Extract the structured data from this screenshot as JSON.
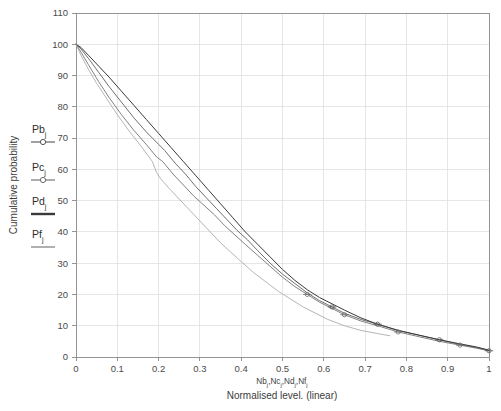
{
  "chart_data": {
    "type": "line",
    "title": "",
    "xlabel": "Normalised level. (linear)",
    "xlabel_secondary": "Nbj,Ncj,Ndj,Nfj",
    "ylabel": "Cumulative probability",
    "xlim": [
      0,
      1
    ],
    "ylim": [
      0,
      110
    ],
    "grid": true,
    "legend_position": "left-outside",
    "xticks": [
      "0",
      "0.1",
      "0.2",
      "0.3",
      "0.4",
      "0.5",
      "0.6",
      "0.7",
      "0.8",
      "0.9",
      "1"
    ],
    "xtick_values": [
      0,
      0.1,
      0.2,
      0.3,
      0.4,
      0.5,
      0.6,
      0.7,
      0.8,
      0.9,
      1
    ],
    "yticks": [
      "0",
      "10",
      "20",
      "30",
      "40",
      "50",
      "60",
      "70",
      "80",
      "90",
      "100",
      "110"
    ],
    "ytick_values": [
      0,
      10,
      20,
      30,
      40,
      50,
      60,
      70,
      80,
      90,
      100,
      110
    ],
    "series": [
      {
        "name": "Pbj",
        "color": "#555555",
        "marker": "circle-bar",
        "x": [
          0.0,
          0.012,
          0.03,
          0.055,
          0.08,
          0.11,
          0.14,
          0.17,
          0.2,
          0.215,
          0.24,
          0.265,
          0.29,
          0.315,
          0.34,
          0.365,
          0.39,
          0.415,
          0.44,
          0.47,
          0.5,
          0.53,
          0.56,
          0.59,
          0.62,
          0.65,
          0.69,
          0.73,
          0.78,
          0.83,
          0.88,
          0.93,
          0.97,
          1.0
        ],
        "y": [
          100.0,
          98.5,
          95.5,
          91.0,
          86.5,
          81.5,
          76.5,
          72.0,
          68.0,
          66.0,
          62.0,
          58.5,
          54.5,
          51.0,
          47.5,
          44.0,
          40.5,
          37.5,
          34.0,
          30.0,
          26.5,
          23.5,
          20.5,
          18.0,
          16.0,
          14.0,
          12.0,
          10.5,
          8.5,
          7.0,
          5.5,
          4.0,
          3.0,
          2.0
        ]
      },
      {
        "name": "Pcj",
        "color": "#6b6b6b",
        "marker": "circle-bar",
        "x": [
          0.0,
          0.012,
          0.03,
          0.055,
          0.08,
          0.11,
          0.14,
          0.17,
          0.195,
          0.21,
          0.235,
          0.26,
          0.285,
          0.31,
          0.335,
          0.36,
          0.385,
          0.41,
          0.44,
          0.47,
          0.5,
          0.53,
          0.56,
          0.59,
          0.62,
          0.65,
          0.69,
          0.73,
          0.78,
          0.83,
          0.88,
          0.93,
          0.97,
          1.0
        ],
        "y": [
          100.0,
          97.5,
          93.5,
          88.0,
          83.0,
          77.5,
          72.5,
          68.0,
          64.0,
          62.5,
          58.5,
          55.0,
          51.5,
          48.5,
          45.5,
          42.0,
          39.0,
          36.0,
          32.5,
          29.0,
          25.5,
          22.5,
          20.0,
          17.5,
          15.5,
          13.5,
          11.5,
          10.0,
          8.0,
          6.5,
          5.0,
          3.8,
          2.8,
          2.0
        ]
      },
      {
        "name": "Pdj",
        "color": "#3a3a3a",
        "marker": "line",
        "x": [
          0.0,
          0.012,
          0.03,
          0.055,
          0.08,
          0.11,
          0.14,
          0.17,
          0.2,
          0.23,
          0.26,
          0.29,
          0.32,
          0.35,
          0.38,
          0.41,
          0.44,
          0.47,
          0.5,
          0.53,
          0.56,
          0.59,
          0.62,
          0.65,
          0.69,
          0.73,
          0.78,
          0.83,
          0.88,
          0.93,
          0.97,
          1.0
        ],
        "y": [
          100.0,
          99.0,
          96.5,
          93.0,
          89.5,
          85.0,
          80.5,
          76.0,
          71.5,
          67.0,
          62.5,
          58.0,
          53.5,
          49.0,
          44.5,
          40.0,
          36.0,
          32.0,
          28.0,
          24.5,
          21.5,
          19.0,
          17.0,
          15.0,
          12.5,
          10.5,
          8.5,
          7.0,
          5.5,
          4.2,
          3.2,
          2.2
        ]
      },
      {
        "name": "Pfj",
        "color": "#a8a8a8",
        "marker": "line",
        "x": [
          0.0,
          0.012,
          0.03,
          0.05,
          0.075,
          0.1,
          0.13,
          0.16,
          0.185,
          0.195,
          0.205,
          0.225,
          0.25,
          0.275,
          0.3,
          0.325,
          0.35,
          0.375,
          0.4,
          0.43,
          0.46,
          0.49,
          0.52,
          0.55,
          0.58,
          0.61,
          0.65,
          0.69,
          0.73,
          0.76
        ],
        "y": [
          100.0,
          96.5,
          92.0,
          87.5,
          82.5,
          77.5,
          72.0,
          67.0,
          62.5,
          59.0,
          57.0,
          54.0,
          50.5,
          47.0,
          43.5,
          40.0,
          36.5,
          33.5,
          30.5,
          27.0,
          24.0,
          21.0,
          18.5,
          16.0,
          14.0,
          12.0,
          10.0,
          8.5,
          7.5,
          6.8
        ]
      }
    ]
  },
  "legend": {
    "items": [
      {
        "label_main": "Pb",
        "label_sub": "j",
        "marker": "circle-bar",
        "color": "#555555"
      },
      {
        "label_main": "Pc",
        "label_sub": "j",
        "marker": "circle-bar",
        "color": "#6b6b6b"
      },
      {
        "label_main": "Pd",
        "label_sub": "j",
        "marker": "line",
        "color": "#3a3a3a"
      },
      {
        "label_main": "Pf",
        "label_sub": "j",
        "marker": "line",
        "color": "#a8a8a8"
      }
    ]
  },
  "axes": {
    "y_title": "Cumulative probability",
    "x_title_line1": "Nb",
    "x_title_line1_full": "Nbj,Ncj,Ndj,Nfj",
    "x_title_line2": "Normalised level. (linear)"
  },
  "colors": {
    "grid": "#d8dde0",
    "axis": "#8a8a8a",
    "text": "#3a3a3a",
    "background": "#ffffff"
  }
}
